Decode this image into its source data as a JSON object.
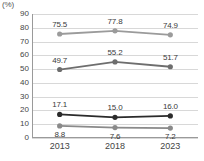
{
  "chart_data": {
    "type": "line",
    "title": "",
    "xlabel": "",
    "ylabel": "(%)",
    "unit_label": "(%)",
    "categories": [
      "2013",
      "2018",
      "2023"
    ],
    "ylim": [
      0,
      90
    ],
    "ytick_step": 10,
    "yticks": [
      "0",
      "10",
      "20",
      "30",
      "40",
      "50",
      "60",
      "70",
      "80",
      "90"
    ],
    "grid": true,
    "legend": "none",
    "series": [
      {
        "name": "series-1",
        "color": "#9b9b9b",
        "marker": "circle",
        "label_position": "above",
        "values": [
          75.5,
          77.8,
          74.9
        ],
        "labels": [
          "75.5",
          "77.8",
          "74.9"
        ]
      },
      {
        "name": "series-2",
        "color": "#6e6e6e",
        "marker": "circle",
        "label_position": "above",
        "values": [
          49.7,
          55.2,
          51.7
        ],
        "labels": [
          "49.7",
          "55.2",
          "51.7"
        ]
      },
      {
        "name": "series-3",
        "color": "#2b2b2b",
        "marker": "circle",
        "label_position": "above",
        "values": [
          17.1,
          15.0,
          16.0
        ],
        "labels": [
          "17.1",
          "15.0",
          "16.0"
        ]
      },
      {
        "name": "series-4",
        "color": "#8a8a8a",
        "marker": "circle",
        "label_position": "below",
        "values": [
          8.8,
          7.6,
          7.2
        ],
        "labels": [
          "8.8",
          "7.6",
          "7.2"
        ]
      }
    ]
  }
}
